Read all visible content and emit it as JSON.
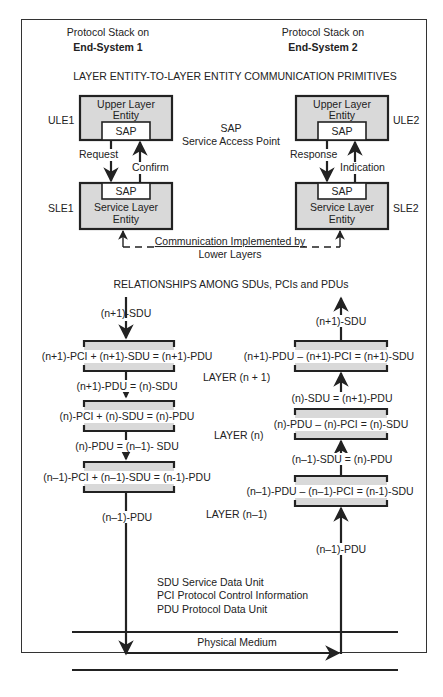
{
  "header": {
    "left_line1": "Protocol Stack on",
    "left_line2": "End-System 1",
    "right_line1": "Protocol Stack on",
    "right_line2": "End-System 2"
  },
  "section1": {
    "title": "LAYER ENTITY-TO-LAYER ENTITY COMMUNICATION PRIMITIVES",
    "ule1": {
      "tag": "ULE1",
      "line1": "Upper Layer",
      "line2": "Entity",
      "sap": "SAP"
    },
    "sle1": {
      "tag": "SLE1",
      "line1": "Service Layer",
      "line2": "Entity",
      "sap": "SAP"
    },
    "ule2": {
      "tag": "ULE2",
      "line1": "Upper Layer",
      "line2": "Entity",
      "sap": "SAP"
    },
    "sle2": {
      "tag": "SLE2",
      "line1": "Service Layer",
      "line2": "Entity",
      "sap": "SAP"
    },
    "request": "Request",
    "confirm": "Confirm",
    "response": "Response",
    "indication": "Indication",
    "sap_label": "SAP",
    "sap_desc": "Service Access Point",
    "lower_line1": "Communication Implemented by",
    "lower_line2": "Lower Layers"
  },
  "section2": {
    "title": "RELATIONSHIPS AMONG SDUs, PCIs and PDUs",
    "left": {
      "in_label": "(n+1)-SDU",
      "eq_n1": "(n+1)-PCI + (n+1)-SDU = (n+1)-PDU",
      "between_1": "(n+1)-PDU = (n)-SDU",
      "eq_n": "(n)-PCI + (n)-SDU = (n)-PDU",
      "between_2": "(n)-PDU = (n–1)- SDU",
      "eq_nm1": "(n–1)-PCI + (n–1)-SDU = (n-1)-PDU",
      "out_label": "(n–1)-PDU"
    },
    "right": {
      "out_label": "(n+1)-SDU",
      "eq_n1": "(n+1)-PDU – (n+1)-PCI = (n+1)-SDU",
      "between_1": "(n)-SDU = (n+1)-PDU",
      "eq_n": "(n)-PDU – (n)-PCI = (n)-SDU",
      "between_2": "(n–1)-SDU = (n)-PDU",
      "eq_nm1": "(n–1)-PDU – (n–1)-PCI = (n-1)-SDU",
      "in_label": "(n–1)-PDU"
    },
    "layers": [
      "LAYER (n + 1)",
      "LAYER (n)",
      "LAYER (n–1)"
    ]
  },
  "legend": [
    "SDU  Service Data Unit",
    "PCI  Protocol Control Information",
    "PDU  Protocol Data Unit"
  ],
  "physical_medium": "Physical Medium",
  "colors": {
    "box_fill": "#d9d9d9",
    "stroke": "#222222"
  }
}
